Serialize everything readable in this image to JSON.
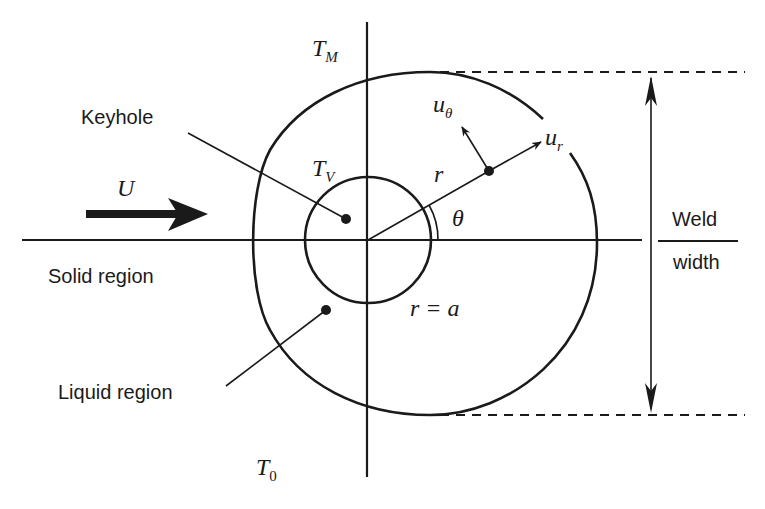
{
  "diagram": {
    "type": "keyhole-weld-pool-schematic",
    "colors": {
      "stroke": "#1a1a1a",
      "background": "#ffffff"
    },
    "labels": {
      "melt_temp": {
        "base": "T",
        "sub": "M"
      },
      "vapor_temp": {
        "base": "T",
        "sub": "V"
      },
      "ambient_temp": {
        "base": "T",
        "sub": "0"
      },
      "u_theta": {
        "base": "u",
        "sub": "θ"
      },
      "u_r": {
        "base": "u",
        "sub": "r"
      },
      "radius": "r",
      "angle": "θ",
      "keyhole_radius": "r = a",
      "velocity": "U",
      "keyhole": "Keyhole",
      "solid_region": "Solid region",
      "liquid_region": "Liquid region",
      "weld_width_top": "Weld",
      "weld_width_bottom": "width"
    },
    "shapes": {
      "center": [
        368,
        240
      ],
      "keyhole_circle_radius": 63,
      "radial_angle_deg": 29.7,
      "melt_boundary": "egg-shaped contour enclosing keyhole, elongated downstream"
    }
  }
}
